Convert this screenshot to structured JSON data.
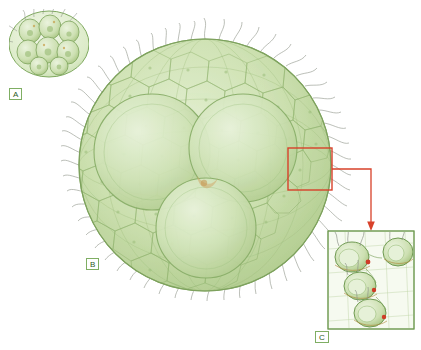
{
  "figure": {
    "background_color": "#ffffff",
    "panels": [
      {
        "id": "A",
        "label": "A",
        "label_x": 10,
        "label_y": 88,
        "description": "small early-stage embryo with few large cells enclosed in an oval envelope",
        "frame": {
          "x": 8,
          "y": 8,
          "w": 82,
          "h": 72
        },
        "cell_count": 8
      },
      {
        "id": "B",
        "label": "B",
        "label_x": 86,
        "label_y": 258,
        "description": "large mature spherical colony with numerous surface cells and flagella",
        "center_x": 205,
        "center_y": 165,
        "radius": 127,
        "daughter_colony_count": 3
      },
      {
        "id": "C",
        "label": "C",
        "label_x": 315,
        "label_y": 331,
        "description": "magnified detail of colony surface cells with flagella and cytoplasmic bridges",
        "frame": {
          "x": 328,
          "y": 231,
          "w": 86,
          "h": 98
        },
        "cell_count": 4
      }
    ],
    "callout": {
      "source_box": {
        "x": 288,
        "y": 148,
        "w": 44,
        "h": 42
      },
      "color": "#d8412a",
      "arrow_target_x": 371,
      "arrow_target_y": 229,
      "description": "red rectangle on colony B linked by an elbow connector and arrow to panel C"
    },
    "colors": {
      "cell_fill_light": "#d9e8c0",
      "cell_fill_mid": "#c2d9a0",
      "cell_fill_dark": "#a9c684",
      "outline_green": "#6f9a52",
      "outline_dark": "#4f7336",
      "callout_red": "#d8412a",
      "flagella_gray": "#8a8f84",
      "label_text": "#2e5c1f"
    }
  }
}
